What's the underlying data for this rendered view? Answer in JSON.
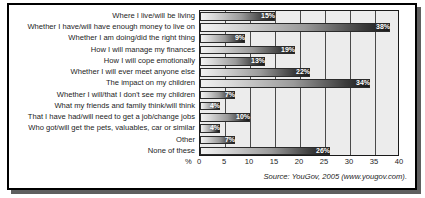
{
  "chart_data": {
    "type": "bar",
    "orientation": "horizontal",
    "title": "",
    "xlabel": "%",
    "ylabel": "",
    "xlim": [
      0,
      40
    ],
    "xticks": [
      0,
      5,
      10,
      15,
      20,
      25,
      30,
      35,
      40
    ],
    "grid": true,
    "legend": "none",
    "categories": [
      "Where I live/will be living",
      "Whether I have/will have enough money to live on",
      "Whether I am doing/did the right thing",
      "How I will manage my finances",
      "How I will cope emotionally",
      "Whether I will ever meet anyone else",
      "The impact on my children",
      "Whether I will/that I don't see my children",
      "What my friends and family think/will think",
      "That I have had/will need to get a job/change jobs",
      "Who got/will get the pets, valuables, car or similar",
      "Other",
      "None of these"
    ],
    "values": [
      15,
      38,
      9,
      19,
      13,
      22,
      34,
      7,
      4,
      10,
      4,
      7,
      26
    ],
    "value_labels": [
      "15%",
      "38%",
      "9%",
      "19%",
      "13%",
      "22%",
      "34%",
      "7%",
      "4%",
      "10%",
      "4%",
      "7%",
      "26%"
    ],
    "source": "Source: YouGov, 2005 (www.yougov.com)."
  },
  "colors": {
    "plot_background": "#ececec",
    "bar_dark": "#1b1b1b",
    "bar_light": "#f2f2f2",
    "axis": "#1a1a1a",
    "text": "#1c1c1c",
    "value_text": "#ffffff"
  }
}
